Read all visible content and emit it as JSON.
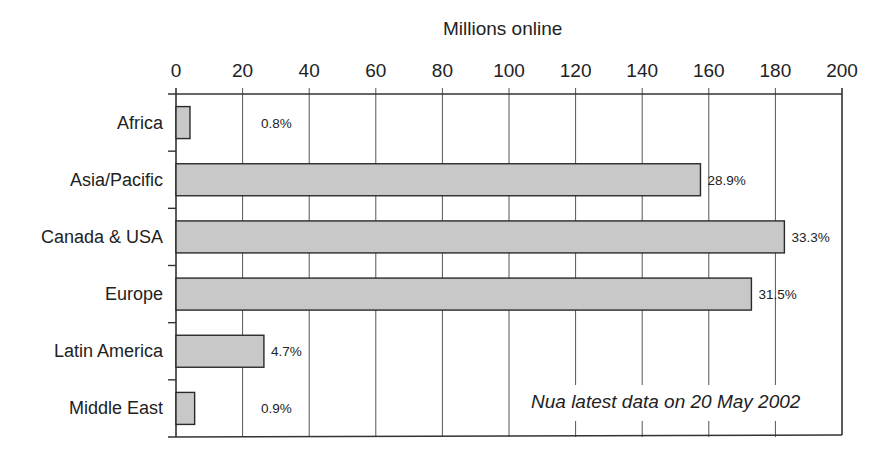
{
  "chart_data": {
    "type": "bar",
    "orientation": "horizontal",
    "title": "",
    "xlabel": "Millions online",
    "ylabel": "",
    "xlim": [
      0,
      200
    ],
    "xticks": [
      0,
      20,
      40,
      60,
      80,
      100,
      120,
      140,
      160,
      180,
      200
    ],
    "x_axis_position": "top",
    "grid": "vertical",
    "legend": null,
    "categories": [
      "Africa",
      "Asia/Pacific",
      "Canada & USA",
      "Europe",
      "Latin America",
      "Middle East"
    ],
    "values": [
      4.2,
      157.5,
      182.7,
      172.8,
      26.4,
      5.6
    ],
    "percent_labels": [
      "0.8%",
      "28.9%",
      "33.3%",
      "31.5%",
      "4.7%",
      "0.9%"
    ],
    "annotation": "Nua latest data on 20 May 2002",
    "bar_color": "#c8c8c8",
    "bar_edge_color": "#2a2a2a"
  },
  "axis": {
    "title": "Millions online",
    "ticks": [
      "0",
      "20",
      "40",
      "60",
      "80",
      "100",
      "120",
      "140",
      "160",
      "180",
      "200"
    ]
  },
  "rows": [
    {
      "label": "Africa",
      "pct": "0.8%"
    },
    {
      "label": "Asia/Pacific",
      "pct": "28.9%"
    },
    {
      "label": "Canada & USA",
      "pct": "33.3%"
    },
    {
      "label": "Europe",
      "pct": "31.5%"
    },
    {
      "label": "Latin America",
      "pct": "4.7%"
    },
    {
      "label": "Middle East",
      "pct": "0.9%"
    }
  ],
  "annotation": "Nua latest data on 20 May 2002"
}
